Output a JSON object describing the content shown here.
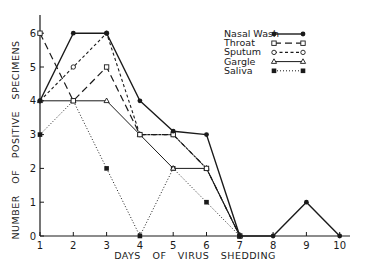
{
  "chart_data": {
    "type": "line",
    "title": "",
    "xlabel": "DAYS OF VIRUS SHEDDING",
    "ylabel": "NUMBER OF POSITIVE SPECIMENS",
    "x": [
      1,
      2,
      3,
      4,
      5,
      6,
      7,
      8,
      9,
      10
    ],
    "x_tick_labels": [
      "1",
      "2",
      "3",
      "4",
      "5",
      "6",
      "7",
      "8",
      "9",
      "10"
    ],
    "y_tick_labels": [
      "0",
      "1",
      "2",
      "3",
      "4",
      "5",
      "6"
    ],
    "xlim": [
      1,
      10
    ],
    "ylim": [
      0,
      6.5
    ],
    "grid": false,
    "legend_position": "upper right",
    "series": [
      {
        "name": "Nasal Wash",
        "style": "solid",
        "marker": "filled-circle",
        "x": [
          1,
          2,
          3,
          4,
          5,
          6,
          7,
          8,
          9,
          10
        ],
        "values": [
          4,
          6,
          6,
          4,
          3.1,
          3,
          0,
          0,
          1,
          0
        ]
      },
      {
        "name": "Throat",
        "style": "long-dash",
        "marker": "open-square",
        "x": [
          1,
          2,
          3,
          4,
          5,
          6,
          7
        ],
        "values": [
          6,
          4,
          5,
          3,
          3,
          2,
          0
        ]
      },
      {
        "name": "Sputum",
        "style": "short-dash",
        "marker": "open-circle",
        "x": [
          1,
          2,
          3,
          4,
          5,
          6,
          7
        ],
        "values": [
          4,
          5,
          6,
          3,
          3,
          2,
          0
        ]
      },
      {
        "name": "Gargle",
        "style": "solid-thin",
        "marker": "open-triangle",
        "x": [
          1,
          2,
          3,
          4,
          5,
          6,
          7
        ],
        "values": [
          4,
          4,
          4,
          3,
          2,
          2,
          0
        ]
      },
      {
        "name": "Saliva",
        "style": "dotted",
        "marker": "filled-square",
        "x": [
          1,
          2,
          3,
          4,
          5,
          6,
          7
        ],
        "values": [
          3,
          4,
          2,
          0,
          2,
          1,
          0
        ]
      }
    ]
  },
  "legend": {
    "items": [
      {
        "label": "Nasal Wash"
      },
      {
        "label": "Throat"
      },
      {
        "label": "Sputum"
      },
      {
        "label": "Gargle"
      },
      {
        "label": "Saliva"
      }
    ]
  },
  "colors": {
    "ink": "#1a1a1a",
    "background": "#ffffff"
  }
}
